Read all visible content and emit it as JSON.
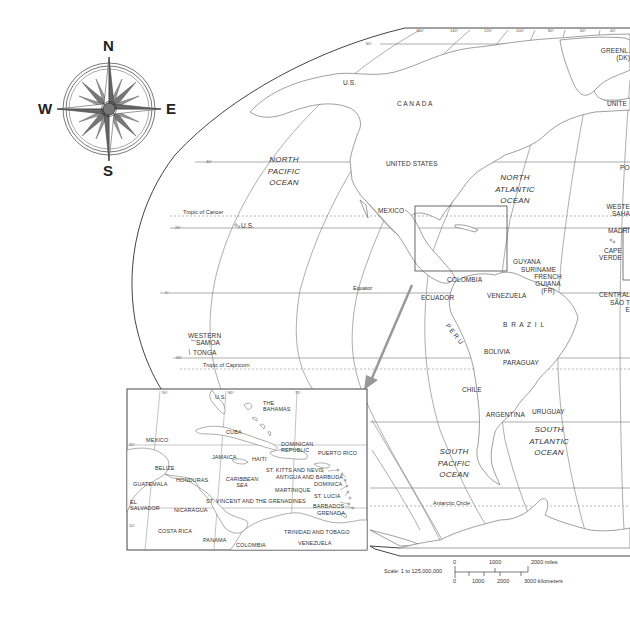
{
  "compass": {
    "north": "N",
    "south": "S",
    "east": "E",
    "west": "W"
  },
  "oceans": {
    "north_pacific": [
      "NORTH",
      "PACIFIC",
      "OCEAN"
    ],
    "north_atlantic": [
      "NORTH",
      "ATLANTIC",
      "OCEAN"
    ],
    "south_pacific": [
      "SOUTH",
      "PACIFIC",
      "OCEAN"
    ],
    "south_atlantic": [
      "SOUTH",
      "ATLANTIC",
      "OCEAN"
    ],
    "caribbean_sea": [
      "CARIBBEAN",
      "SEA"
    ]
  },
  "lines": {
    "tropic_of_cancer": "Tropic of Cancer",
    "equator": "Equator",
    "tropic_of_capricorn": "Tropic of Capricorn",
    "antarctic_circle": "Antarctic Circle"
  },
  "main_map_labels": {
    "us_alaska": "U.S.",
    "canada": "C A N A D A",
    "greenland": [
      "GREENL.",
      "(DK)"
    ],
    "united_kingdom_partial": "UNITE",
    "united_states": "UNITED  STATES",
    "mexico": "MEXICO",
    "us_hawaii": "U.S.",
    "portugal_partial": "PO",
    "western_sahara_partial": [
      "WESTE",
      "SAHA"
    ],
    "madrid_partial": "MADRI",
    "cape_verde": [
      "CAPE",
      "VERDE"
    ],
    "guyana": "GUYANA",
    "suriname": "SURINAME",
    "french_guiana": [
      "FRENCH",
      "GUIANA",
      "(FR)"
    ],
    "colombia": "COLOMBIA",
    "venezuela": "VENEZUELA",
    "ecuador": "ECUADOR",
    "central_partial": "CENTRAL",
    "sao_tome_partial": [
      "SÃO T",
      "E"
    ],
    "peru": "P E R U",
    "brazil": "B R A Z I L",
    "bolivia": "BOLIVIA",
    "paraguay": "PARAGUAY",
    "chile": "CHILE",
    "argentina": "ARGENTINA",
    "uruguay": "URUGUAY",
    "western_samoa": [
      "WESTERN",
      "SAMOA"
    ],
    "tonga": "TONGA"
  },
  "degree_labels": {
    "top": [
      "160°",
      "140°",
      "120°",
      "100°",
      "80°",
      "60°",
      "40°"
    ],
    "left": [
      "60°",
      "40°",
      "20°",
      "0°",
      "20°"
    ],
    "inset": [
      "90°",
      "80°",
      "70°",
      "20°",
      "10°"
    ]
  },
  "inset_labels": {
    "us": "U.S.",
    "bahamas": [
      "THE",
      "BAHAMAS"
    ],
    "cuba": "CUBA",
    "mexico": "MEXICO",
    "jamaica": "JAMAICA",
    "haiti": "HAITI",
    "dominican_republic": [
      "DOMINICAN",
      "REPUBLIC"
    ],
    "puerto_rico": "PUERTO RICO",
    "belize": "BELIZE",
    "guatemala": "GUATEMALA",
    "honduras": "HONDURAS",
    "el_salvador": [
      "EL",
      "SALVADOR"
    ],
    "nicaragua": "NICARAGUA",
    "costa_rica": "COSTA RICA",
    "panama": "PANAMA",
    "colombia": "COLOMBIA",
    "venezuela": "VENEZUELA",
    "st_kitts_nevis": "ST. KITTS AND NEVIS",
    "antigua_barbuda": "ANTIGUA AND BARBUDA",
    "dominica": "DOMINICA",
    "martinique": "MARTINIQUE",
    "st_lucia": "ST. LUCIA",
    "st_vincent": "ST. VINCENT AND THE GRENADINES",
    "barbados": "BARBADOS",
    "grenada": "GRENADA",
    "trinidad_tobago": "TRINIDAD AND TOBAGO"
  },
  "scale": {
    "label": "Scale:  1 to 125,000,000",
    "miles_ticks": [
      "0",
      "1000",
      "2000 miles"
    ],
    "km_ticks": [
      "0",
      "1000",
      "2000",
      "3000 kilometers"
    ]
  },
  "colors": {
    "line": "#555555",
    "land_outline": "#777777",
    "grid": "#888888",
    "compass_fill": "#666666",
    "arrow": "#999999"
  }
}
